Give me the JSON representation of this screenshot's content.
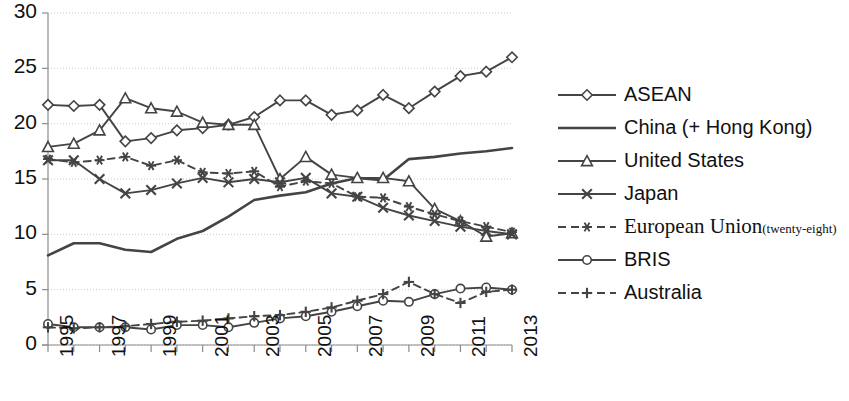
{
  "chart_data": {
    "type": "line",
    "title": "",
    "subtitle": "",
    "xlabel": "",
    "ylabel": "",
    "xlim": [
      1995,
      2013
    ],
    "ylim": [
      0,
      30
    ],
    "y_ticks": [
      0,
      5,
      10,
      15,
      20,
      25,
      30
    ],
    "x_ticks_all": [
      1995,
      1996,
      1997,
      1998,
      1999,
      2000,
      2001,
      2002,
      2003,
      2004,
      2005,
      2006,
      2007,
      2008,
      2009,
      2010,
      2011,
      2012,
      2013
    ],
    "x_tick_labels": [
      "1995",
      "1997",
      "1999",
      "2001",
      "2003",
      "2005",
      "2007",
      "2009",
      "2011",
      "2013"
    ],
    "x_tick_labelled_years": [
      1995,
      1997,
      1999,
      2001,
      2003,
      2005,
      2007,
      2009,
      2011,
      2013
    ],
    "grid": true,
    "grid_axis": "y",
    "legend_position": "right",
    "x": [
      1995,
      1996,
      1997,
      1998,
      1999,
      2000,
      2001,
      2002,
      2003,
      2004,
      2005,
      2006,
      2007,
      2008,
      2009,
      2010,
      2011,
      2012,
      2013
    ],
    "series": [
      {
        "name": "ASEAN",
        "marker": "diamond-open",
        "dash": "solid",
        "color": "#444444",
        "values": [
          21.7,
          21.6,
          21.7,
          18.4,
          18.7,
          19.4,
          19.6,
          19.9,
          20.6,
          22.1,
          22.1,
          20.8,
          21.2,
          22.6,
          21.4,
          22.9,
          24.3,
          24.7,
          26.0
        ]
      },
      {
        "name": "China (+ Hong Kong)",
        "marker": "none",
        "dash": "solid",
        "color": "#444444",
        "values": [
          8.1,
          9.2,
          9.2,
          8.6,
          8.4,
          9.6,
          10.3,
          11.6,
          13.1,
          13.5,
          13.8,
          14.6,
          15.1,
          14.9,
          16.8,
          17.0,
          17.3,
          17.5,
          17.8
        ]
      },
      {
        "name": "United States",
        "marker": "triangle-open",
        "dash": "solid",
        "color": "#444444",
        "values": [
          17.9,
          18.2,
          19.4,
          22.3,
          21.4,
          21.1,
          20.1,
          19.9,
          19.9,
          15.0,
          17.0,
          15.4,
          15.1,
          15.1,
          14.8,
          12.3,
          11.2,
          9.8,
          10.1
        ]
      },
      {
        "name": "Japan",
        "marker": "x-cross",
        "dash": "solid",
        "color": "#444444",
        "values": [
          16.7,
          16.7,
          15.0,
          13.7,
          14.0,
          14.6,
          15.1,
          14.7,
          15.0,
          14.7,
          15.1,
          13.7,
          13.4,
          12.4,
          11.7,
          11.2,
          10.7,
          10.3,
          10.0
        ]
      },
      {
        "name": "European Union",
        "name_suffix": "(twenty-eight)",
        "marker": "asterisk",
        "dash": "dashed",
        "color": "#444444",
        "values": [
          16.8,
          16.5,
          16.7,
          17.0,
          16.2,
          16.7,
          15.6,
          15.5,
          15.7,
          14.3,
          14.8,
          14.6,
          13.4,
          13.3,
          12.5,
          11.8,
          11.2,
          10.7,
          10.2
        ]
      },
      {
        "name": "BRIS",
        "marker": "circle-open",
        "dash": "solid",
        "color": "#444444",
        "values": [
          1.9,
          1.6,
          1.6,
          1.6,
          1.4,
          1.8,
          1.8,
          1.6,
          2.0,
          2.4,
          2.6,
          3.0,
          3.5,
          4.0,
          3.9,
          4.6,
          5.1,
          5.2,
          5.0
        ]
      },
      {
        "name": "Australia",
        "marker": "plus",
        "dash": "dashed",
        "color": "#444444",
        "values": [
          1.6,
          1.5,
          1.6,
          1.7,
          1.9,
          2.1,
          2.2,
          2.4,
          2.6,
          2.7,
          3.0,
          3.4,
          4.0,
          4.6,
          5.7,
          4.6,
          3.8,
          4.8,
          5.0
        ]
      }
    ]
  },
  "legend": {
    "items": [
      {
        "label": "ASEAN",
        "marker": "diamond-open",
        "dash": "solid"
      },
      {
        "label": "China (+ Hong Kong)",
        "marker": "none",
        "dash": "solid"
      },
      {
        "label": "United States",
        "marker": "triangle-open",
        "dash": "solid"
      },
      {
        "label": "Japan",
        "marker": "x-cross",
        "dash": "solid"
      },
      {
        "label": "European Union",
        "sublabel": "(twenty-eight)",
        "marker": "asterisk",
        "dash": "dashed"
      },
      {
        "label": "BRIS",
        "marker": "circle-open",
        "dash": "solid"
      },
      {
        "label": "Australia",
        "marker": "plus",
        "dash": "dashed"
      }
    ]
  },
  "colors": {
    "line": "#444444",
    "grid": "#c9c9c9",
    "axis": "#8c8c8c",
    "text": "#111111",
    "background": "#ffffff"
  }
}
